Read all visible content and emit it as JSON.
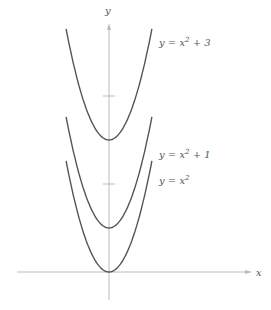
{
  "chart_data": {
    "type": "line",
    "title": "",
    "xlabel": "x",
    "ylabel": "y",
    "xlim": [
      -3.8,
      5.3
    ],
    "ylim": [
      -1.0,
      5.7
    ],
    "grid": false,
    "y_ticks": [
      2,
      4
    ],
    "series": [
      {
        "name": "y = x^2 + 3",
        "label": "y = x² + 3",
        "function": "x^2+3",
        "x_range": [
          -1.59,
          1.59
        ]
      },
      {
        "name": "y = x^2 + 1",
        "label": "y = x² + 1",
        "function": "x^2+1",
        "x_range": [
          -1.59,
          1.59
        ]
      },
      {
        "name": "y = x^2",
        "label": "y = x²",
        "function": "x^2",
        "x_range": [
          -1.59,
          1.59
        ]
      }
    ],
    "annotations": [
      "y = x² + 3",
      "y = x² + 1",
      "y = x²"
    ]
  },
  "axes": {
    "x_label": "x",
    "y_label": "y"
  },
  "labels": {
    "top": "y = x",
    "top_sup": "2",
    "top_rest": " + 3",
    "mid": "y = x",
    "mid_sup": "2",
    "mid_rest": " + 1",
    "bot": "y = x",
    "bot_sup": "2"
  },
  "colors": {
    "axis": "#bbbbbb",
    "curve": "#555555",
    "text": "#555555"
  }
}
